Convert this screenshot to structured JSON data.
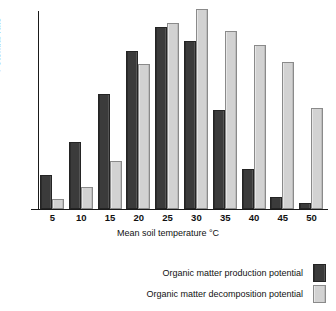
{
  "chart_data": {
    "type": "bar",
    "title": "",
    "xlabel": "Mean soil temperature °C",
    "ylabel": "Potential rate",
    "categories": [
      "5",
      "10",
      "15",
      "20",
      "25",
      "30",
      "35",
      "40",
      "45",
      "50"
    ],
    "grid": false,
    "legend_position": "bottom-right",
    "ylim": [
      0,
      100
    ],
    "y_ticks": [],
    "series": [
      {
        "name": "Organic matter production potential",
        "color": "#3b3b3b",
        "values": [
          16,
          33,
          57,
          79,
          91,
          84,
          49,
          19,
          5,
          2
        ]
      },
      {
        "name": "Organic matter decomposition potential",
        "color": "#d2d2d2",
        "values": [
          4,
          10,
          23,
          72,
          93,
          100,
          89,
          82,
          73,
          50
        ]
      }
    ]
  },
  "axes": {
    "y_title": "Potential rate",
    "x_title": "Mean soil temperature °C"
  },
  "legend": {
    "items": [
      {
        "label": "Organic matter production potential",
        "swatch": "dark"
      },
      {
        "label": "Organic matter decomposition potential",
        "swatch": "light"
      }
    ]
  }
}
